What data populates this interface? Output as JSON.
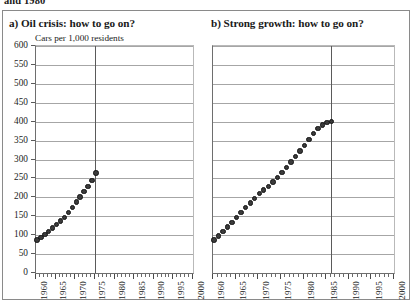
{
  "caption_fragment": "and 1980",
  "figure": {
    "y_axis": {
      "label": "Cars per 1,000 residents",
      "ticks": [
        0,
        50,
        100,
        150,
        200,
        250,
        300,
        350,
        400,
        450,
        500,
        550,
        600
      ],
      "min": 0,
      "max": 600,
      "step": 50
    },
    "x_axis": {
      "labels": [
        "1960",
        "1965",
        "1970",
        "1975",
        "1980",
        "1985",
        "1990",
        "1995",
        "2000"
      ],
      "min": 1960,
      "max": 2000,
      "major_step": 5,
      "minor_step": 1
    }
  },
  "panels": [
    {
      "id": "a",
      "title": "a) Oil crisis: how to go on?"
    },
    {
      "id": "b",
      "title": "b) Strong growth: how to go on?"
    }
  ],
  "chart_data": [
    {
      "type": "scatter",
      "title": "a) Oil crisis: how to go on?",
      "subtitle": "Cars per 1,000 residents",
      "xlabel": "",
      "ylabel": "Cars per 1,000 residents",
      "xlim": [
        1960,
        2000
      ],
      "ylim": [
        0,
        600
      ],
      "ytick_step": 50,
      "xtick_step": 5,
      "grid": "horizontal",
      "legend": "none",
      "reference_line_x": 1975,
      "x": [
        1960,
        1961,
        1962,
        1963,
        1964,
        1965,
        1966,
        1967,
        1968,
        1969,
        1970,
        1971,
        1972,
        1973,
        1974,
        1975
      ],
      "y": [
        90,
        97,
        105,
        113,
        122,
        131,
        140,
        150,
        162,
        175,
        190,
        204,
        218,
        232,
        247,
        267
      ]
    },
    {
      "type": "scatter",
      "title": "b) Strong growth: how to go on?",
      "subtitle": "",
      "xlabel": "",
      "ylabel": "Cars per 1,000 residents",
      "xlim": [
        1960,
        2000
      ],
      "ylim": [
        0,
        600
      ],
      "ytick_step": 50,
      "xtick_step": 5,
      "grid": "horizontal",
      "legend": "none",
      "reference_line_x": 1986,
      "x": [
        1960,
        1961,
        1962,
        1963,
        1964,
        1965,
        1966,
        1967,
        1968,
        1969,
        1970,
        1971,
        1972,
        1973,
        1974,
        1975,
        1976,
        1977,
        1978,
        1979,
        1980,
        1981,
        1982,
        1983,
        1984,
        1985,
        1986
      ],
      "y": [
        90,
        100,
        112,
        124,
        136,
        149,
        162,
        175,
        188,
        200,
        212,
        222,
        232,
        243,
        255,
        268,
        282,
        296,
        310,
        325,
        340,
        356,
        372,
        385,
        394,
        400,
        403
      ]
    }
  ]
}
